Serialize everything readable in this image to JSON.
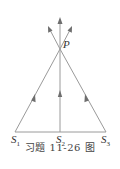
{
  "figure": {
    "caption": "习题 11-26 图",
    "point_label": "P",
    "sources": [
      {
        "name": "S",
        "sub": "1"
      },
      {
        "name": "S",
        "sub": "2"
      },
      {
        "name": "S",
        "sub": "3"
      }
    ],
    "colors": {
      "line": "#9a9a9a",
      "arrow": "#6e6e6e",
      "text": "#333333"
    }
  }
}
